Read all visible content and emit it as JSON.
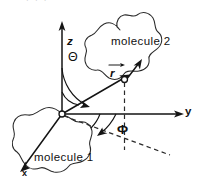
{
  "figure": {
    "kind": "spherical-coordinate-diagram",
    "background_color": "#ffffff",
    "ink_color": "#141414",
    "width": 198,
    "height": 187,
    "top_fragment_text": "·  ·   ·",
    "labels": {
      "molecule_2": "molecule 2",
      "molecule_1": "molecule 1",
      "axis_z": "z",
      "axis_y": "y",
      "axis_x": "x",
      "angle_theta": "Θ",
      "angle_phi": "Φ",
      "vector_r": "r"
    },
    "axes": [
      {
        "name": "z",
        "label": "z",
        "direction": "up"
      },
      {
        "name": "y",
        "label": "y",
        "direction": "right"
      },
      {
        "name": "x",
        "label": "x",
        "direction": "down-left"
      }
    ],
    "angles": [
      {
        "name": "theta",
        "symbol": "Θ",
        "between": "z-axis and r vector"
      },
      {
        "name": "phi",
        "symbol": "Φ",
        "between": "y-axis and projection of r"
      }
    ],
    "vectors": [
      {
        "name": "r",
        "symbol": "r",
        "overbar": "arrow",
        "from": "origin",
        "to": "molecule-2 point"
      },
      {
        "name": "orientation",
        "symbol": "",
        "at": "molecule-2 point",
        "direction": "up-right"
      }
    ],
    "objects": [
      {
        "name": "molecule-1",
        "label": "molecule 1",
        "location": "origin, lower-left"
      },
      {
        "name": "molecule-2",
        "label": "molecule 2",
        "location": "upper-right"
      }
    ]
  }
}
